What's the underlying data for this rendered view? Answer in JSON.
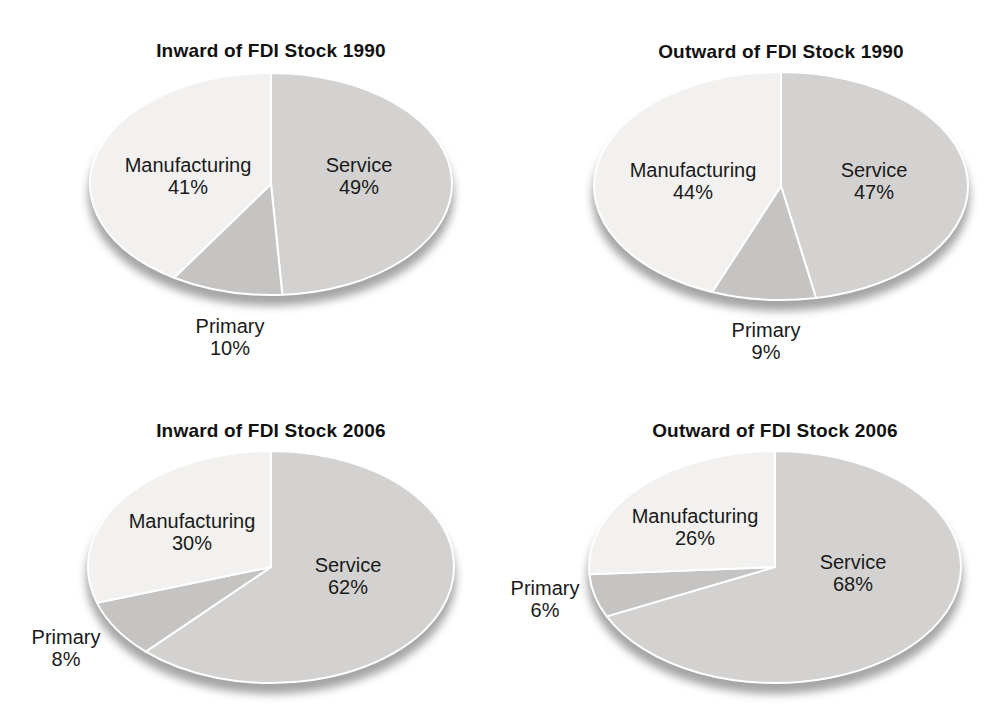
{
  "figure": {
    "background": "#ffffff"
  },
  "colors": {
    "service": "#d3d2d1",
    "primary": "#c5c4c2",
    "manufacturing": "#f2f1ef",
    "shadow": "#a5a5a5",
    "divider": "#ffffff",
    "label_text": "#1a1a1a",
    "title_text": "#111111"
  },
  "chart_data": [
    {
      "type": "pie",
      "title": "Inward of FDI Stock 1990",
      "start_angle_deg": 0,
      "direction": "clockwise",
      "slices": [
        {
          "label": "Service",
          "value": 49,
          "pct_label": "49%"
        },
        {
          "label": "Primary",
          "value": 10,
          "pct_label": "10%"
        },
        {
          "label": "Manufacturing",
          "value": 41,
          "pct_label": "41%"
        }
      ],
      "layout": {
        "cx": 271,
        "cy": 184,
        "rx": 181,
        "ry": 111,
        "labels": {
          "Service": [
            359,
            175
          ],
          "Primary": [
            230,
            336
          ],
          "Manufacturing": [
            188,
            175
          ]
        },
        "outside_labels": [
          "Primary"
        ]
      }
    },
    {
      "type": "pie",
      "title": "Outward of FDI Stock 1990",
      "start_angle_deg": 0,
      "direction": "clockwise",
      "slices": [
        {
          "label": "Service",
          "value": 47,
          "pct_label": "47%"
        },
        {
          "label": "Primary",
          "value": 9,
          "pct_label": "9%"
        },
        {
          "label": "Manufacturing",
          "value": 44,
          "pct_label": "44%"
        }
      ],
      "layout": {
        "cx": 282,
        "cy": 186,
        "rx": 187,
        "ry": 114,
        "labels": {
          "Service": [
            375,
            180
          ],
          "Primary": [
            267,
            340
          ],
          "Manufacturing": [
            194,
            180
          ]
        },
        "outside_labels": [
          "Primary"
        ]
      }
    },
    {
      "type": "pie",
      "title": "Inward of FDI Stock 2006",
      "start_angle_deg": 0,
      "direction": "clockwise",
      "slices": [
        {
          "label": "Service",
          "value": 62,
          "pct_label": "62%"
        },
        {
          "label": "Primary",
          "value": 8,
          "pct_label": "8%"
        },
        {
          "label": "Manufacturing",
          "value": 30,
          "pct_label": "30%"
        }
      ],
      "layout": {
        "cx": 271,
        "cy": 204,
        "rx": 183,
        "ry": 116,
        "labels": {
          "Service": [
            348,
            212
          ],
          "Primary": [
            66,
            284
          ],
          "Manufacturing": [
            192,
            168
          ]
        },
        "outside_labels": [
          "Primary"
        ]
      }
    },
    {
      "type": "pie",
      "title": "Outward of FDI Stock 2006",
      "start_angle_deg": 0,
      "direction": "clockwise",
      "slices": [
        {
          "label": "Service",
          "value": 68,
          "pct_label": "68%"
        },
        {
          "label": "Primary",
          "value": 6,
          "pct_label": "6%"
        },
        {
          "label": "Manufacturing",
          "value": 26,
          "pct_label": "26%"
        }
      ],
      "layout": {
        "cx": 276,
        "cy": 204,
        "rx": 186,
        "ry": 116,
        "labels": {
          "Service": [
            354,
            209
          ],
          "Primary": [
            46,
            235
          ],
          "Manufacturing": [
            196,
            163
          ]
        },
        "outside_labels": [
          "Primary"
        ]
      }
    }
  ]
}
